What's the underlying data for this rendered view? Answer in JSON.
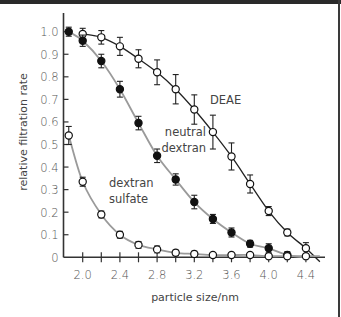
{
  "chart_data": {
    "type": "line",
    "title": "",
    "xlabel": "particle size/nm",
    "ylabel": "relative filtration rate",
    "xlim": [
      1.8,
      4.55
    ],
    "ylim": [
      0,
      1.05
    ],
    "xticks": [
      2.0,
      2.2,
      2.4,
      2.6,
      2.8,
      3.0,
      3.2,
      3.4,
      3.6,
      3.8,
      4.0,
      4.2,
      4.4
    ],
    "xtick_labels": [
      "2.0",
      "",
      "2.4",
      "",
      "2.8",
      "",
      "3.2",
      "",
      "3.6",
      "",
      "4.0",
      "",
      "4.4"
    ],
    "yticks": [
      0,
      0.1,
      0.2,
      0.3,
      0.4,
      0.5,
      0.6,
      0.7,
      0.8,
      0.9,
      1.0
    ],
    "ytick_labels": [
      "0",
      "0.1",
      "0.2",
      "0.3",
      "0.4",
      "0.5",
      "0.6",
      "0.7",
      "0.8",
      "0.9",
      "1.0"
    ],
    "grid": false,
    "legend": "none (inline labels)",
    "series": [
      {
        "name": "DEAE",
        "label_lines": [
          "DEAE"
        ],
        "marker": "open-circle",
        "line_color": "#222222",
        "x": [
          2.0,
          2.2,
          2.4,
          2.6,
          2.8,
          3.0,
          3.2,
          3.4,
          3.6,
          3.8,
          4.0,
          4.2,
          4.4
        ],
        "y": [
          0.99,
          0.975,
          0.935,
          0.88,
          0.82,
          0.745,
          0.655,
          0.555,
          0.447,
          0.325,
          0.205,
          0.11,
          0.04
        ],
        "err": [
          0.025,
          0.03,
          0.04,
          0.04,
          0.055,
          0.065,
          0.065,
          0.075,
          0.06,
          0.04,
          0.02,
          0.015,
          0.025
        ]
      },
      {
        "name": "neutral dextran",
        "label_lines": [
          "neutral",
          "dextran"
        ],
        "marker": "filled-circle",
        "line_color": "#9a9a9a",
        "x": [
          1.85,
          2.0,
          2.2,
          2.4,
          2.6,
          2.8,
          3.0,
          3.2,
          3.4,
          3.6,
          3.8,
          4.0,
          4.2
        ],
        "y": [
          1.0,
          0.96,
          0.87,
          0.745,
          0.595,
          0.45,
          0.345,
          0.245,
          0.17,
          0.11,
          0.06,
          0.04,
          0.01
        ],
        "err": [
          0.02,
          0.025,
          0.03,
          0.035,
          0.03,
          0.03,
          0.025,
          0.03,
          0.02,
          0.02,
          0.015,
          0.02,
          0.015
        ]
      },
      {
        "name": "dextran sulfate",
        "label_lines": [
          "dextran",
          "sulfate"
        ],
        "marker": "open-circle",
        "line_color": "#9a9a9a",
        "x": [
          1.85,
          2.0,
          2.2,
          2.4,
          2.6,
          2.8,
          3.0,
          3.2,
          3.4,
          3.6,
          3.8,
          4.0,
          4.2,
          4.4
        ],
        "y": [
          0.54,
          0.335,
          0.19,
          0.1,
          0.055,
          0.035,
          0.02,
          0.015,
          0.01,
          0.01,
          0.01,
          0.005,
          0.005,
          0.005
        ],
        "err": [
          0.04,
          0.02,
          0.015,
          0.015,
          0.015,
          0.015,
          0.012,
          0.012,
          0.008,
          0.008,
          0.008,
          0.008,
          0.008,
          0.008
        ]
      }
    ]
  },
  "labels": {
    "deae": "DEAE",
    "neutral_1": "neutral",
    "neutral_2": "dextran",
    "sulfate_1": "dextran",
    "sulfate_2": "sulfate",
    "xlabel": "particle size/nm",
    "ylabel": "relative filtration rate"
  },
  "colors": {
    "axis": "#333333",
    "deae_line": "#222222",
    "grey_line": "#9a9a9a",
    "marker_stroke": "#111111",
    "text": "#555555"
  }
}
